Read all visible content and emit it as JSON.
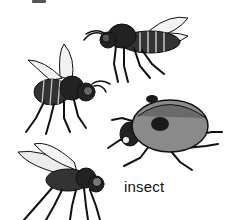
{
  "image": {
    "caption": "insect",
    "subjects": [
      {
        "name": "bee",
        "position": "top-right"
      },
      {
        "name": "bee",
        "position": "middle-left"
      },
      {
        "name": "ladybug",
        "position": "middle-right"
      },
      {
        "name": "fly",
        "position": "bottom-left"
      }
    ],
    "colors": {
      "background": "#ffffff",
      "ink": "#111111",
      "ladybug_shell": "#8a8a8a",
      "ladybug_spot": "#1a1a1a"
    }
  }
}
